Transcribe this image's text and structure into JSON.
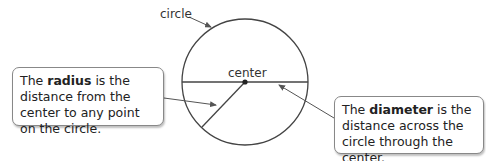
{
  "labels": {
    "circle": "circle",
    "center": "center"
  },
  "radius_box": {
    "pre": "The ",
    "term": "radius",
    "post": " is the distance from the center to any point on the circle."
  },
  "diameter_box": {
    "pre": "The ",
    "term": "diameter",
    "post": " is the distance across the circle through the center."
  }
}
